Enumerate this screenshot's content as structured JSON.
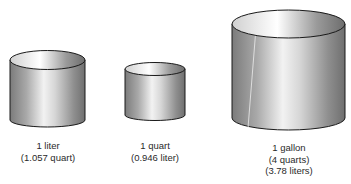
{
  "figure": {
    "containers": [
      {
        "name": "liter",
        "lines": [
          "1 liter",
          "(1.057 quart)"
        ]
      },
      {
        "name": "quart",
        "lines": [
          "1 quart",
          "(0.946 liter)"
        ]
      },
      {
        "name": "gallon",
        "lines": [
          "1 gallon",
          "(4 quarts)",
          "(3.78 liters)"
        ]
      }
    ],
    "colors": {
      "outline": "#1a1a1a",
      "shade_dark": "#7a7a7a",
      "shade_light": "#f4f4f4"
    }
  }
}
